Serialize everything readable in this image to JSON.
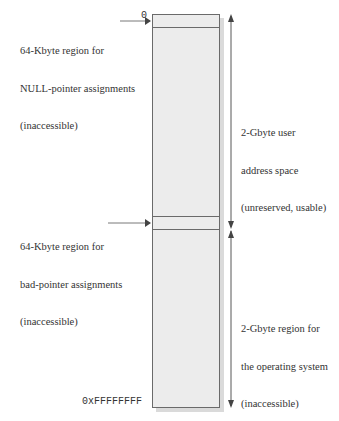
{
  "diagram": {
    "address_labels": {
      "start": "0",
      "end": "0xFFFFFFFF"
    },
    "left_annotations": [
      {
        "id": "null-pointer-region",
        "lines": [
          "64-Kbyte region for",
          "NULL-pointer assignments",
          "(inaccessible)"
        ]
      },
      {
        "id": "bad-pointer-region",
        "lines": [
          "64-Kbyte region for",
          "bad-pointer assignments",
          "(inaccessible)"
        ]
      }
    ],
    "right_annotations": [
      {
        "id": "user-address-space",
        "lines": [
          "2-Gbyte user",
          "address space",
          "(unreserved, usable)"
        ]
      },
      {
        "id": "os-region",
        "lines": [
          "2-Gbyte region for",
          "the operating system",
          "(inaccessible)"
        ]
      }
    ],
    "regions": [
      {
        "name": "NULL-pointer region",
        "size": "64-Kbyte",
        "access": "inaccessible"
      },
      {
        "name": "User address space",
        "size": "2-Gbyte",
        "access": "unreserved, usable"
      },
      {
        "name": "Bad-pointer region",
        "size": "64-Kbyte",
        "access": "inaccessible"
      },
      {
        "name": "Operating system region",
        "size": "2-Gbyte",
        "access": "inaccessible"
      }
    ],
    "colors": {
      "box_fill": "#ececec",
      "box_border": "#6a6a6a",
      "shadow": "#dadada",
      "arrow": "#444444"
    }
  }
}
